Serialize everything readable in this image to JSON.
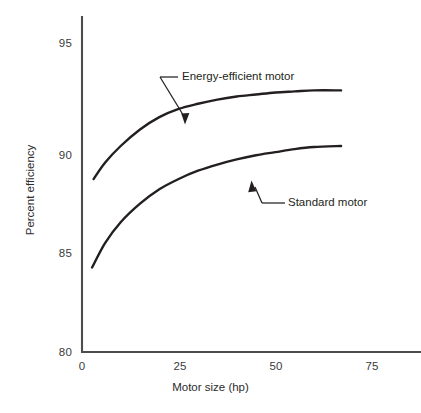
{
  "chart_data": {
    "type": "line",
    "title": "",
    "xlabel": "Motor size (hp)",
    "ylabel": "Percent efficiency",
    "xlim": [
      0,
      80
    ],
    "ylim": [
      80,
      96
    ],
    "xticks": [
      0,
      25,
      50,
      75
    ],
    "xtick_labels": [
      "0",
      "25",
      "50",
      "75"
    ],
    "yticks": [
      80,
      85,
      90,
      95
    ],
    "ytick_labels": [
      "80",
      "85",
      "90",
      "95"
    ],
    "grid": false,
    "legend": "annotations",
    "line_color": "#231f20",
    "axis_color": "#4d4d4d",
    "background": "#ffffff",
    "series": [
      {
        "name": "Energy-efficient motor",
        "annotation": "Energy-efficient motor",
        "x": [
          3,
          6,
          10,
          15,
          20,
          25,
          30,
          35,
          40,
          45,
          50,
          55,
          60,
          67
        ],
        "values": [
          88.4,
          89.2,
          90.0,
          90.8,
          91.4,
          91.8,
          92.05,
          92.25,
          92.4,
          92.5,
          92.6,
          92.65,
          92.7,
          92.7
        ]
      },
      {
        "name": "Standard motor",
        "annotation": "Standard motor",
        "x": [
          2.6,
          6,
          10,
          15,
          20,
          25,
          30,
          35,
          40,
          45,
          50,
          55,
          60,
          67
        ],
        "values": [
          84.1,
          85.3,
          86.3,
          87.2,
          87.9,
          88.4,
          88.8,
          89.1,
          89.35,
          89.55,
          89.7,
          89.85,
          89.95,
          90.0
        ]
      }
    ],
    "annotations": [
      {
        "name": "energy-efficient-motor-callout",
        "text": "Energy-efficient motor",
        "points_to_series": "Energy-efficient motor"
      },
      {
        "name": "standard-motor-callout",
        "text": "Standard motor",
        "points_to_series": "Standard motor"
      }
    ]
  }
}
